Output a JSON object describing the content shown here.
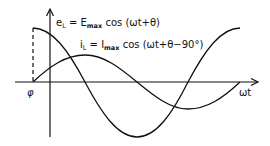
{
  "diagram": {
    "x_axis_label": "ωt",
    "phase_label": "φ",
    "curves": [
      {
        "name": "voltage",
        "symbol": "e",
        "symbol_sub": "L",
        "equals": " = E",
        "amp_sub": "max",
        "expr": " cos (ωt+θ)"
      },
      {
        "name": "current",
        "symbol": "i",
        "symbol_sub": "L",
        "equals": " = I",
        "amp_sub": "max",
        "expr": " cos (ωt+θ−90°)"
      }
    ],
    "colors": {
      "stroke": "#111111",
      "background": "#ffffff"
    }
  }
}
